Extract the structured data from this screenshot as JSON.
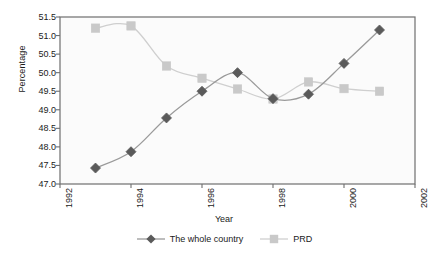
{
  "chart_data": {
    "type": "line",
    "title": "",
    "xlabel": "Year",
    "ylabel": "Percentage",
    "xlim": [
      1992,
      2002
    ],
    "ylim": [
      47.0,
      51.5
    ],
    "xticks": [
      "1992",
      "1994",
      "1996",
      "1998",
      "2000",
      "2002"
    ],
    "xtick_values": [
      1992,
      1994,
      1996,
      1998,
      2000,
      2002
    ],
    "yticks": [
      "47.0",
      "47.5",
      "48.0",
      "48.5",
      "49.0",
      "49.5",
      "50.0",
      "50.5",
      "51.0",
      "51.5"
    ],
    "ytick_values": [
      47.0,
      47.5,
      48.0,
      48.5,
      49.0,
      49.5,
      50.0,
      50.5,
      51.0,
      51.5
    ],
    "grid": false,
    "legend_position": "bottom-center",
    "x": [
      1993,
      1994,
      1995,
      1996,
      1997,
      1998,
      1999,
      2000,
      2001
    ],
    "series": [
      {
        "name": "The whole country",
        "marker": "diamond",
        "color": "#5a5a5a",
        "line_color": "#9a9a9a",
        "values": [
          47.43,
          47.87,
          48.78,
          49.5,
          50.0,
          49.3,
          49.42,
          50.25,
          51.15
        ]
      },
      {
        "name": "PRD",
        "marker": "square",
        "color": "#c9c9c9",
        "line_color": "#cfcfcf",
        "values": [
          51.2,
          51.26,
          50.18,
          49.85,
          49.56,
          49.29,
          49.75,
          49.57,
          49.5
        ]
      }
    ]
  },
  "legend": {
    "items": [
      {
        "label": "The whole country"
      },
      {
        "label": "PRD"
      }
    ]
  }
}
